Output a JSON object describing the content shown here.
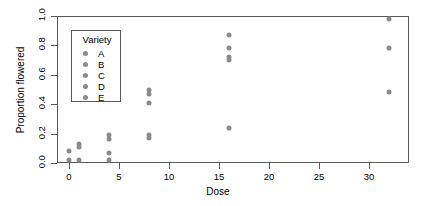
{
  "chart_data": {
    "type": "scatter",
    "title": "",
    "xlabel": "Dose",
    "ylabel": "Proportion flowered",
    "xlim": [
      -1.2,
      34.0
    ],
    "ylim": [
      0.0,
      1.0
    ],
    "xticks": [
      0,
      5,
      10,
      15,
      20,
      25,
      30
    ],
    "yticks": [
      0.0,
      0.2,
      0.4,
      0.6,
      0.8,
      1.0
    ],
    "grid": false,
    "point_color": "#8a8a8a",
    "frame_color": "#595959",
    "legend": {
      "title": "Variety",
      "position": "upper-left-inside",
      "entries": [
        {
          "label": "A",
          "color": "#8a8a8a"
        },
        {
          "label": "B",
          "color": "#8a8a8a"
        },
        {
          "label": "C",
          "color": "#8a8a8a"
        },
        {
          "label": "D",
          "color": "#8a8a8a"
        },
        {
          "label": "E",
          "color": "#8a8a8a"
        }
      ]
    },
    "points": [
      {
        "x": 0,
        "y": 0.08
      },
      {
        "x": 0,
        "y": 0.02
      },
      {
        "x": 1,
        "y": 0.13
      },
      {
        "x": 1,
        "y": 0.11
      },
      {
        "x": 1,
        "y": 0.02
      },
      {
        "x": 4,
        "y": 0.19
      },
      {
        "x": 4,
        "y": 0.16
      },
      {
        "x": 4,
        "y": 0.07
      },
      {
        "x": 4,
        "y": 0.02
      },
      {
        "x": 8,
        "y": 0.5
      },
      {
        "x": 8,
        "y": 0.47
      },
      {
        "x": 8,
        "y": 0.41
      },
      {
        "x": 8,
        "y": 0.19
      },
      {
        "x": 8,
        "y": 0.17
      },
      {
        "x": 16,
        "y": 0.87
      },
      {
        "x": 16,
        "y": 0.78
      },
      {
        "x": 16,
        "y": 0.72
      },
      {
        "x": 16,
        "y": 0.7
      },
      {
        "x": 16,
        "y": 0.24
      },
      {
        "x": 32,
        "y": 0.98
      },
      {
        "x": 32,
        "y": 0.78
      },
      {
        "x": 32,
        "y": 0.48
      }
    ]
  }
}
